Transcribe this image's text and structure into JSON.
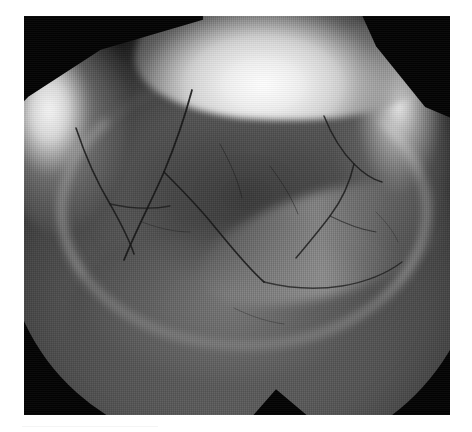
{
  "page": {
    "width": 472,
    "height": 432,
    "background_color": "#ffffff",
    "type": "grayscale-photographic-plate"
  },
  "plate": {
    "label": "specimen-photograph",
    "x": 24,
    "y": 16,
    "width": 426,
    "height": 399,
    "background_color": "#030303",
    "subject": "tooth-crown-occlusal-surface",
    "modality": "grayscale macro / electron micrograph",
    "description": "Rounded molar crown seen from the occlusal aspect, lit from the upper right, showing a bright specular crown ridge, a recessed central basin and a branching network of enamel cracks and fissures.",
    "tone_range": {
      "black_point": "#030303",
      "shadow": "#1c1c1c",
      "midtone": "#5c5c5c",
      "highlight": "#d2d2d2",
      "specular": "#ffffff"
    }
  },
  "features": {
    "crown_highlight": "bright specular band across the upper crown margin",
    "left_rim": "rim light along the left shoulder of the crown",
    "right_rim": "rim light along the right cusp",
    "basin": "darker recessed central occlusal table",
    "marginal_ridge": "bright encircling arc around the central basin",
    "lower_lobe": "rounded cervical bulge in the lower half",
    "notch": "angular notch in the silhouette at the lower centre",
    "texture": "fine vertical raster / halftone scanlines across the whole plate"
  },
  "caption": {
    "rule_color": "#f4f4f4",
    "text": ""
  }
}
